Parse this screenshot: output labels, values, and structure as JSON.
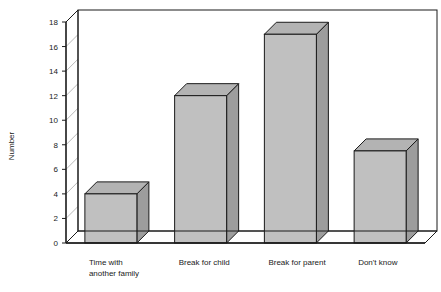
{
  "chart_data": {
    "type": "bar",
    "title": "",
    "subtitle": "",
    "xlabel": "",
    "ylabel": "Number",
    "categories": [
      "Time with another family",
      "Break for child",
      "Break for parent",
      "Don't know"
    ],
    "values": [
      4,
      12,
      17,
      7.5
    ],
    "ylim": [
      0,
      18
    ],
    "ytick_step": 2,
    "yticks": [
      "0",
      "2",
      "4",
      "6",
      "8",
      "10",
      "12",
      "14",
      "16",
      "18"
    ],
    "grid": true,
    "grid_axis": "y",
    "legend": "none",
    "style": "3d",
    "colors": {
      "bar_front": "#c0c0c0",
      "bar_top": "#b3b3b3",
      "bar_side": "#9d9d9d",
      "bar_outline": "#1a1a1a",
      "grid_line": "#b9b9b9",
      "axis_line": "#1a1a1a",
      "plot_background": "#ffffff",
      "page_background": "#ffffff"
    }
  },
  "labels": {
    "cat_lines": [
      [
        "Time with",
        "another family"
      ],
      [
        "Break for child"
      ],
      [
        "Break for parent"
      ],
      [
        "Don't know"
      ]
    ]
  }
}
